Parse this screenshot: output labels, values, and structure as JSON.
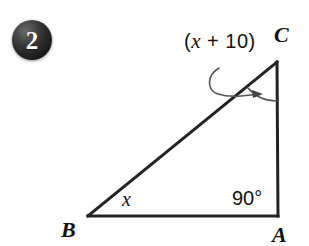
{
  "figure": {
    "problem_number": "2",
    "shape": "right-triangle",
    "colors": {
      "stroke": "#222222",
      "background": "#ffffff",
      "badge_fill": "#1b1b1b",
      "badge_text": "#ffffff",
      "annotation_stroke": "#555555"
    },
    "vertices": [
      {
        "name": "C",
        "label": "C",
        "x": 277,
        "y": 62
      },
      {
        "name": "B",
        "label": "B",
        "x": 88,
        "y": 216
      },
      {
        "name": "A",
        "label": "A",
        "x": 278,
        "y": 216
      }
    ],
    "sides": [
      {
        "name": "hypotenuse-BC",
        "from": "B",
        "to": "C"
      },
      {
        "name": "base-BA",
        "from": "B",
        "to": "A"
      },
      {
        "name": "vertical-AC",
        "from": "A",
        "to": "C"
      }
    ],
    "angles": [
      {
        "at": "C",
        "label_prefix": "(",
        "label_variable": "x",
        "label_operator": "+",
        "label_constant": "10",
        "label_suffix": ")",
        "label": "(x + 10)",
        "marked_with_arc": true,
        "marked_with_arrow": true
      },
      {
        "at": "B",
        "label": "x",
        "marked_with_arc": false,
        "marked_with_arrow": false
      },
      {
        "at": "A",
        "label": "90°",
        "marked_with_arc": false,
        "marked_with_arrow": false,
        "is_right_angle": true
      }
    ]
  }
}
